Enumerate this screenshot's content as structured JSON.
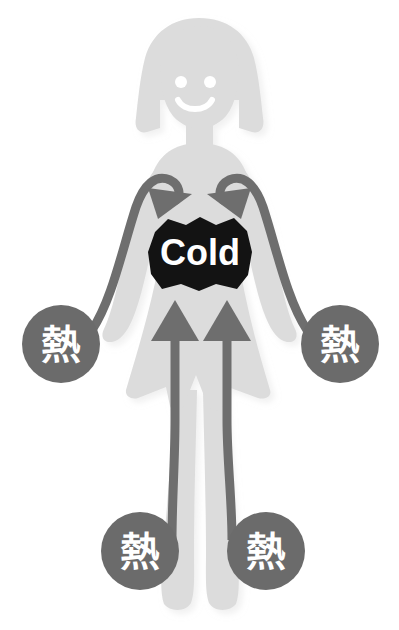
{
  "figure": {
    "background_color": "#ffffff"
  },
  "colors": {
    "body_silhouette": "#dcdcdc",
    "body_shadow": "#cfcfcf",
    "arrow": "#6e6e6e",
    "circle_badge": "#6b6b6b",
    "cold_patch": "#131313",
    "label_text": "#ffffff",
    "face_feature": "#ffffff"
  },
  "core": {
    "label": "Cold",
    "name": "cold-core-patch"
  },
  "heat_badges": [
    {
      "id": "left-hand",
      "label": "熱",
      "cx": 61,
      "cy": 344,
      "r": 39
    },
    {
      "id": "right-hand",
      "label": "熱",
      "cx": 340,
      "cy": 344,
      "r": 39
    },
    {
      "id": "left-foot",
      "label": "熱",
      "cx": 140,
      "cy": 551,
      "r": 39
    },
    {
      "id": "right-foot",
      "label": "熱",
      "cx": 266,
      "cy": 551,
      "r": 39
    }
  ],
  "arrows": [
    {
      "id": "left-arm-inward",
      "direction": "down-right",
      "origin": "left-hand",
      "target": "cold-core"
    },
    {
      "id": "right-arm-inward",
      "direction": "down-left",
      "origin": "right-hand",
      "target": "cold-core"
    },
    {
      "id": "left-leg-upward",
      "direction": "up",
      "origin": "left-foot",
      "target": "cold-core"
    },
    {
      "id": "right-leg-upward",
      "direction": "up",
      "origin": "right-foot",
      "target": "cold-core"
    }
  ],
  "face": {
    "left_eye": "eye",
    "right_eye": "eye",
    "mouth": "smile"
  }
}
